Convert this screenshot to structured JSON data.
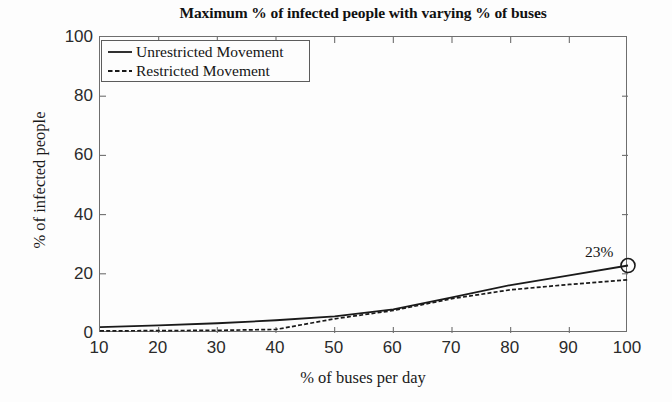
{
  "chart_data": {
    "type": "line",
    "title": "Maximum % of infected people with varying % of buses",
    "xlabel": "% of buses per day",
    "ylabel": "% of infected people",
    "xlim": [
      10,
      100
    ],
    "ylim": [
      0,
      100
    ],
    "xticks": [
      10,
      20,
      30,
      40,
      50,
      60,
      70,
      80,
      90,
      100
    ],
    "yticks": [
      0,
      20,
      40,
      60,
      80,
      100
    ],
    "grid": false,
    "legend_position": "upper left",
    "x": [
      10,
      20,
      30,
      40,
      50,
      60,
      70,
      80,
      90,
      100
    ],
    "series": [
      {
        "name": "Unrestricted Movement",
        "style": "solid",
        "color": "#1a1a1a",
        "values": [
          2.0,
          2.6,
          3.3,
          4.3,
          5.6,
          8.0,
          12.0,
          16.2,
          19.5,
          22.8
        ]
      },
      {
        "name": "Restricted Movement",
        "style": "dashed",
        "color": "#1a1a1a",
        "values": [
          0.7,
          0.8,
          0.9,
          1.2,
          4.8,
          7.6,
          11.6,
          14.6,
          16.4,
          18.0
        ]
      }
    ],
    "annotations": [
      {
        "label": "23%",
        "x": 100,
        "y": 22.8,
        "marker": "circle"
      }
    ]
  },
  "legend": {
    "items": [
      {
        "label": "Unrestricted Movement",
        "style": "solid"
      },
      {
        "label": "Restricted Movement",
        "style": "dashed"
      }
    ]
  },
  "colors": {
    "background": "#fdfdfd",
    "axis": "#6e6e6e",
    "line": "#1a1a1a",
    "text": "#1a1a1a"
  }
}
